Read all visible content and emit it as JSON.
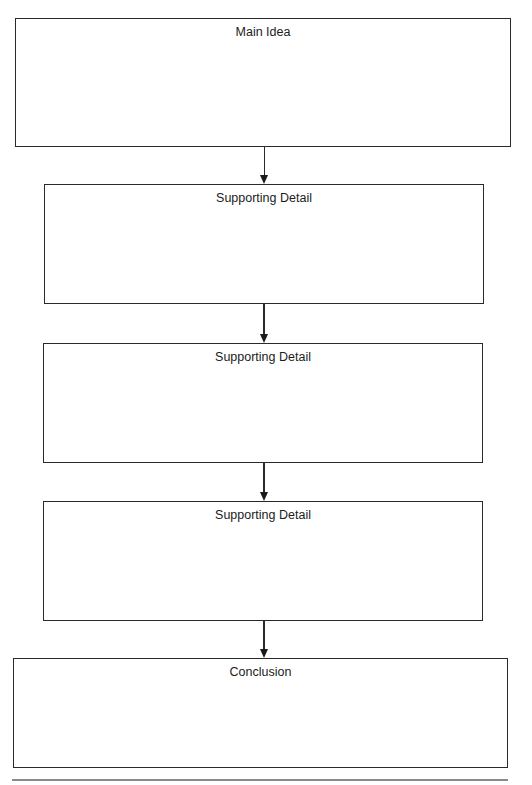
{
  "diagram": {
    "type": "flowchart",
    "direction": "top-to-bottom",
    "boxes": [
      {
        "id": "main-idea",
        "label": "Main Idea"
      },
      {
        "id": "supporting-detail-1",
        "label": "Supporting Detail"
      },
      {
        "id": "supporting-detail-2",
        "label": "Supporting Detail"
      },
      {
        "id": "supporting-detail-3",
        "label": "Supporting Detail"
      },
      {
        "id": "conclusion",
        "label": "Conclusion"
      }
    ],
    "edges": [
      {
        "from": "main-idea",
        "to": "supporting-detail-1"
      },
      {
        "from": "supporting-detail-1",
        "to": "supporting-detail-2"
      },
      {
        "from": "supporting-detail-2",
        "to": "supporting-detail-3"
      },
      {
        "from": "supporting-detail-3",
        "to": "conclusion"
      }
    ],
    "colors": {
      "stroke": "#2a2a2a",
      "background": "#ffffff",
      "rule": "#8a8a8a"
    }
  }
}
